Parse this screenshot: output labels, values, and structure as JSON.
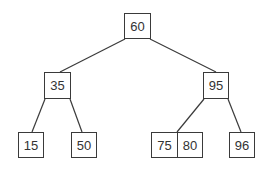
{
  "diagram": {
    "type": "tree",
    "nodes": [
      {
        "id": "n60",
        "label": "60",
        "x": 124,
        "y": 13,
        "w": 27,
        "h": 26
      },
      {
        "id": "n35",
        "label": "35",
        "x": 44,
        "y": 72,
        "w": 27,
        "h": 27
      },
      {
        "id": "n95",
        "label": "95",
        "x": 203,
        "y": 72,
        "w": 26,
        "h": 27
      },
      {
        "id": "n15",
        "label": "15",
        "x": 18,
        "y": 132,
        "w": 26,
        "h": 26
      },
      {
        "id": "n50",
        "label": "50",
        "x": 71,
        "y": 132,
        "w": 26,
        "h": 26
      },
      {
        "id": "n75",
        "label": "75",
        "x": 151,
        "y": 132,
        "w": 26,
        "h": 26
      },
      {
        "id": "n80",
        "label": "80",
        "x": 177,
        "y": 132,
        "w": 26,
        "h": 26
      },
      {
        "id": "n96",
        "label": "96",
        "x": 229,
        "y": 132,
        "w": 26,
        "h": 26
      }
    ],
    "edges": [
      {
        "from": "n60",
        "to": "n35"
      },
      {
        "from": "n60",
        "to": "n95"
      },
      {
        "from": "n35",
        "to": "n15"
      },
      {
        "from": "n35",
        "to": "n50"
      },
      {
        "from": "n95",
        "to": "n75-80"
      },
      {
        "from": "n95",
        "to": "n96"
      }
    ]
  }
}
